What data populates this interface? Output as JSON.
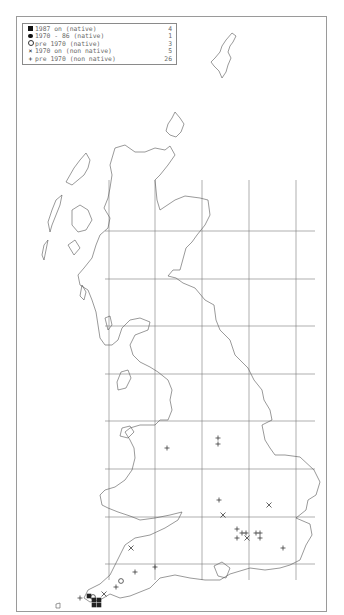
{
  "legend": {
    "items": [
      {
        "symbol": "filled-square",
        "label": "1987 on (native)",
        "count": "4"
      },
      {
        "symbol": "filled-circle",
        "label": "1970 - 86 (native)",
        "count": "1"
      },
      {
        "symbol": "open-circle",
        "label": "pre 1970 (native)",
        "count": "3"
      },
      {
        "symbol": "cross-x",
        "label": "1970 on (non native)",
        "count": "5"
      },
      {
        "symbol": "plus",
        "label": "pre 1970 (non native)",
        "count": "26"
      }
    ]
  },
  "map": {
    "region": "Great Britain",
    "grid": {
      "vertical_x": [
        109,
        155,
        202,
        249,
        296
      ],
      "horizontal_y": [
        231,
        279,
        326,
        374,
        421,
        469,
        517,
        564
      ]
    },
    "colors": {
      "coast": "#555555",
      "grid": "#777777",
      "marker": "#222222"
    },
    "records": {
      "filled_square": [
        [
          89,
          596
        ],
        [
          94,
          600
        ],
        [
          99,
          600
        ],
        [
          94,
          605
        ],
        [
          99,
          605
        ]
      ],
      "open_circle": [
        [
          121,
          581
        ],
        [
          93,
          597
        ]
      ],
      "cross_x": [
        [
          131,
          548
        ],
        [
          223,
          515
        ],
        [
          269,
          505
        ],
        [
          247,
          538
        ],
        [
          104,
          594
        ]
      ],
      "plus": [
        [
          167,
          448
        ],
        [
          218,
          438
        ],
        [
          218,
          444
        ],
        [
          219,
          500
        ],
        [
          237,
          529
        ],
        [
          242,
          533
        ],
        [
          246,
          533
        ],
        [
          237,
          538
        ],
        [
          256,
          533
        ],
        [
          260,
          533
        ],
        [
          260,
          538
        ],
        [
          283,
          548
        ],
        [
          135,
          572
        ],
        [
          155,
          567
        ],
        [
          116,
          587
        ],
        [
          80,
          598
        ]
      ]
    }
  }
}
